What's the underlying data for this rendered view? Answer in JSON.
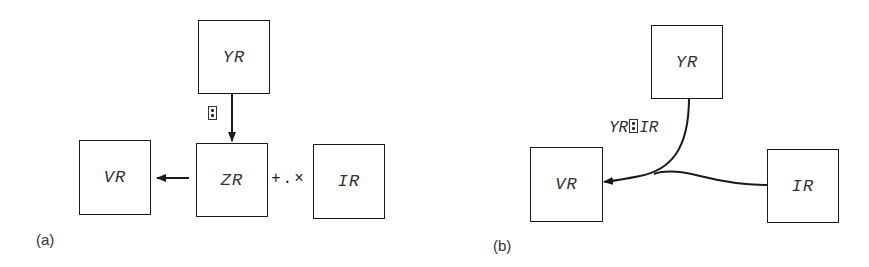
{
  "panel_a": {
    "label": "(a)",
    "boxes": {
      "yr": "YR",
      "zr": "ZR",
      "vr": "VR",
      "ir": "IR"
    },
    "divide_symbol": "matrix-divide-icon",
    "inner_product": "+.×"
  },
  "panel_b": {
    "label": "(b)",
    "boxes": {
      "yr": "YR",
      "vr": "VR",
      "ir": "IR"
    },
    "edge_label": {
      "left": "YR",
      "symbol": "matrix-divide-icon",
      "right": "IR"
    }
  },
  "colors": {
    "line": "#1a1a1a",
    "text": "#333333",
    "background": "#ffffff"
  }
}
